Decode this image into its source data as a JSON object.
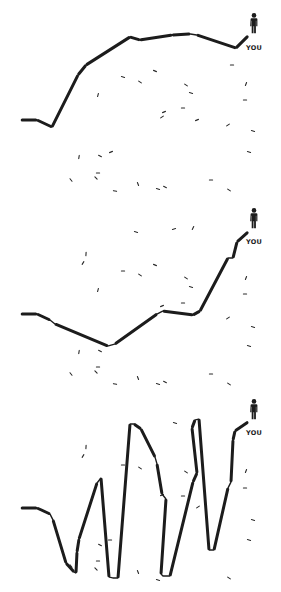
{
  "colors": {
    "background": "#ffffff",
    "path": "#1c1c1c",
    "scatter": "#2a2a2a",
    "person": "#1c1c1c"
  },
  "marker_label": "YOU",
  "panels": [
    {
      "name": "panel-steady-climb",
      "path": [
        [
          21,
          120
        ],
        [
          37,
          120
        ],
        [
          52,
          127
        ],
        [
          78,
          75
        ],
        [
          86,
          65
        ],
        [
          130,
          37
        ],
        [
          140,
          40
        ],
        [
          172,
          35
        ],
        [
          190,
          34
        ],
        [
          197,
          35
        ],
        [
          236,
          48
        ],
        [
          248,
          36
        ]
      ],
      "person": {
        "x": 254,
        "y": 18
      },
      "label": {
        "x": 254,
        "y": 50
      },
      "scatter": [
        [
          123,
          77,
          0.3
        ],
        [
          140,
          82,
          0.6
        ],
        [
          155,
          71,
          0.4
        ],
        [
          186,
          85,
          0.6
        ],
        [
          191,
          93,
          0.3
        ],
        [
          183,
          108,
          0.0
        ],
        [
          164,
          112,
          -0.4
        ],
        [
          162,
          117,
          -0.6
        ],
        [
          197,
          120,
          -0.4
        ],
        [
          228,
          125,
          -0.6
        ],
        [
          232,
          65,
          0.0
        ],
        [
          246,
          84,
          -1.2
        ],
        [
          245,
          100,
          0.0
        ],
        [
          253,
          131,
          0.3
        ],
        [
          98,
          95,
          -1.3
        ],
        [
          249,
          152,
          0.3
        ],
        [
          79,
          157,
          -1.4
        ],
        [
          100,
          156,
          0.5
        ],
        [
          111,
          152,
          -0.4
        ],
        [
          71,
          180,
          0.9
        ],
        [
          96,
          178,
          0.8
        ],
        [
          98,
          173,
          0.0
        ],
        [
          115,
          191,
          0.2
        ],
        [
          138,
          184,
          1.2
        ],
        [
          158,
          189,
          0.3
        ],
        [
          165,
          187,
          0.5
        ],
        [
          211,
          180,
          0.0
        ],
        [
          229,
          190,
          0.6
        ]
      ]
    },
    {
      "name": "panel-dip-then-rise",
      "path": [
        [
          21,
          314
        ],
        [
          37,
          314
        ],
        [
          50,
          320
        ],
        [
          55,
          324
        ],
        [
          108,
          346
        ],
        [
          115,
          344
        ],
        [
          157,
          314
        ],
        [
          163,
          311
        ],
        [
          193,
          315
        ],
        [
          200,
          311
        ],
        [
          228,
          258
        ],
        [
          233,
          258
        ],
        [
          237,
          242
        ],
        [
          248,
          232
        ]
      ],
      "person": {
        "x": 254,
        "y": 213
      },
      "label": {
        "x": 254,
        "y": 244
      },
      "scatter": [
        [
          136,
          232,
          0.3
        ],
        [
          174,
          229,
          -0.3
        ],
        [
          193,
          228,
          -1.1
        ],
        [
          86,
          254,
          -1.5
        ],
        [
          83,
          263,
          -1.0
        ],
        [
          123,
          271,
          0.0
        ],
        [
          140,
          275,
          0.6
        ],
        [
          155,
          265,
          0.4
        ],
        [
          186,
          278,
          0.6
        ],
        [
          191,
          287,
          0.3
        ],
        [
          183,
          303,
          0.0
        ],
        [
          162,
          306,
          -0.4
        ],
        [
          98,
          290,
          -1.3
        ],
        [
          246,
          278,
          -1.2
        ],
        [
          245,
          294,
          0.0
        ],
        [
          228,
          318,
          -0.6
        ],
        [
          253,
          327,
          0.3
        ],
        [
          249,
          346,
          0.3
        ],
        [
          79,
          352,
          -1.4
        ],
        [
          100,
          351,
          0.5
        ],
        [
          98,
          367,
          0.0
        ],
        [
          71,
          374,
          0.9
        ],
        [
          96,
          372,
          0.8
        ],
        [
          115,
          384,
          0.2
        ],
        [
          138,
          378,
          1.2
        ],
        [
          158,
          384,
          0.3
        ],
        [
          165,
          382,
          0.5
        ],
        [
          211,
          374,
          0.0
        ],
        [
          229,
          384,
          0.6
        ]
      ]
    },
    {
      "name": "panel-volatile",
      "path": [
        [
          21,
          508
        ],
        [
          37,
          508
        ],
        [
          50,
          514
        ],
        [
          53,
          520
        ],
        [
          66,
          563
        ],
        [
          74,
          572
        ],
        [
          76,
          573
        ],
        [
          77,
          552
        ],
        [
          79,
          539
        ],
        [
          97,
          483
        ],
        [
          101,
          478
        ],
        [
          109,
          577
        ],
        [
          113,
          578
        ],
        [
          118,
          578
        ],
        [
          130,
          424
        ],
        [
          134,
          424
        ],
        [
          141,
          429
        ],
        [
          155,
          457
        ],
        [
          157,
          464
        ],
        [
          162,
          494
        ],
        [
          166,
          499
        ],
        [
          161,
          574
        ],
        [
          163,
          576
        ],
        [
          170,
          576
        ],
        [
          193,
          482
        ],
        [
          197,
          473
        ],
        [
          192,
          428
        ],
        [
          195,
          420
        ],
        [
          199,
          419
        ],
        [
          209,
          550
        ],
        [
          214,
          550
        ],
        [
          228,
          488
        ],
        [
          231,
          482
        ],
        [
          233,
          440
        ],
        [
          235,
          431
        ],
        [
          248,
          422
        ]
      ],
      "person": {
        "x": 254,
        "y": 404
      },
      "label": {
        "x": 254,
        "y": 435
      },
      "scatter": [
        [
          175,
          423,
          0.3
        ],
        [
          86,
          447,
          -1.5
        ],
        [
          83,
          456,
          -1.0
        ],
        [
          123,
          465,
          0.0
        ],
        [
          140,
          468,
          0.6
        ],
        [
          186,
          472,
          0.6
        ],
        [
          183,
          496,
          0.0
        ],
        [
          162,
          495,
          -0.4
        ],
        [
          198,
          507,
          -0.6
        ],
        [
          246,
          471,
          -1.2
        ],
        [
          245,
          488,
          0.0
        ],
        [
          253,
          520,
          0.3
        ],
        [
          249,
          540,
          0.3
        ],
        [
          110,
          540,
          0.0
        ],
        [
          100,
          545,
          0.5
        ],
        [
          98,
          561,
          0.0
        ],
        [
          71,
          566,
          0.9
        ],
        [
          96,
          569,
          0.8
        ],
        [
          138,
          572,
          1.2
        ],
        [
          158,
          580,
          0.3
        ],
        [
          229,
          578,
          0.6
        ]
      ]
    }
  ]
}
